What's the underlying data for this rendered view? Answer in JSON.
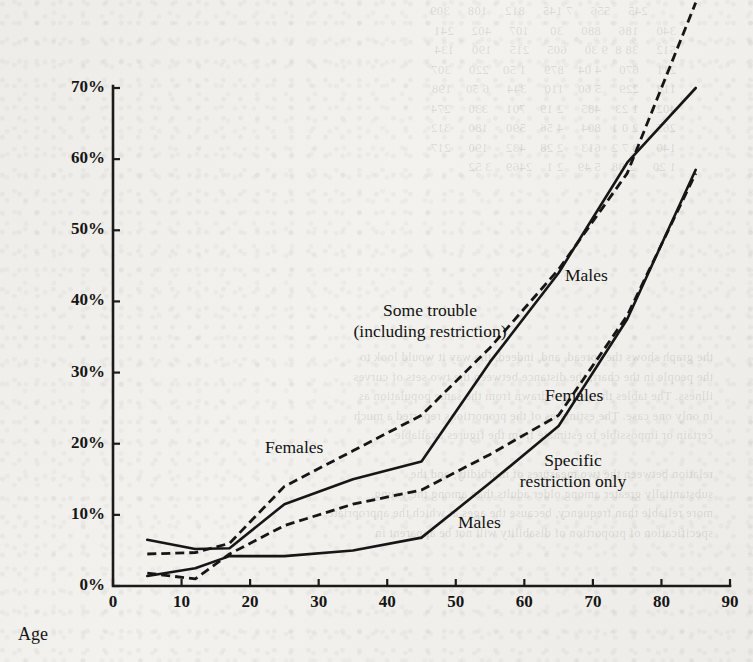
{
  "page": {
    "background_color": "#f2f1ee",
    "ink_color": "#161616",
    "bleed_through_text_top": "          245     556     7 145     812     108     309\n  340     186     880     30      107     402     241\n  512     38 8  9 30     605     215     190     134\n  211     670     4 04    879     1 50    220     307\n  118     229     5 60    110     344     6 50    198\n  402     1 23    485     2 19    701     330     274\n  265     2 0 1   804     4 56    590     180     312\n  140     3 7 2   613     2 28    432     190     217\n  1 20     2 88   5 49    2 1    2469    3 52",
    "bleed_through_text_bottom": "the graph shows the spread, and, indeed, the way it would look to\nthe people in the chart, the distance between the two sets of curves\nillness. The tables that are not drawn from the same population as\nin only one case. The estimates of the proportions reported a much\ncertain or impossible to estimate from the figures available\n\nrelation between the two measures of morbidity, and the\nsubstantially greater among older adults than among the young,\nmore reliable than frequency, because the ages at which the appropriate\nspecification of proportion of disability will not be apparent in"
  },
  "chart_data": {
    "type": "line",
    "title": "",
    "xlabel": "Age",
    "ylabel": "",
    "xlim": [
      0,
      90
    ],
    "ylim": [
      0,
      70
    ],
    "grid": false,
    "legend_position": "inline-annotations",
    "x_ticks": [
      "0",
      "10",
      "20",
      "30",
      "40",
      "50",
      "60",
      "70",
      "80",
      "90"
    ],
    "y_ticks": [
      "0%",
      "10%",
      "20%",
      "30%",
      "40%",
      "50%",
      "60%",
      "70%"
    ],
    "annotations": [
      {
        "text_line1": "Some trouble",
        "text_line2": "(including restriction)",
        "x_px": 430,
        "y_px": 300
      },
      {
        "text_line1": "Specific",
        "text_line2": "restriction only",
        "x_px": 573,
        "y_px": 450
      },
      {
        "text_line1": "Males",
        "text_line2": "",
        "x_px": 565,
        "y_px": 265
      },
      {
        "text_line1": "Females",
        "text_line2": "",
        "x_px": 545,
        "y_px": 385
      },
      {
        "text_line1": "Females",
        "text_line2": "",
        "x_px": 265,
        "y_px": 437
      },
      {
        "text_line1": "Males",
        "text_line2": "",
        "x_px": 458,
        "y_px": 512
      }
    ],
    "series": [
      {
        "name": "Females — some trouble (including restriction)",
        "group": "Females",
        "measure": "Some trouble (including restriction)",
        "style": "dashed",
        "x": [
          5,
          12,
          17,
          25,
          35,
          45,
          55,
          65,
          75,
          85
        ],
        "y": [
          4.5,
          4.7,
          6.0,
          14.0,
          19.0,
          24.0,
          33.5,
          44.5,
          58.0,
          82.0
        ]
      },
      {
        "name": "Males — some trouble (including restriction)",
        "group": "Males",
        "measure": "Some trouble (including restriction)",
        "style": "solid",
        "x": [
          5,
          12,
          17,
          25,
          35,
          45,
          55,
          65,
          75,
          85
        ],
        "y": [
          6.5,
          5.2,
          5.3,
          11.5,
          15.0,
          17.5,
          31.5,
          44.0,
          59.5,
          70.0
        ]
      },
      {
        "name": "Females — specific restriction only",
        "group": "Females",
        "measure": "Specific restriction only",
        "style": "dashed",
        "x": [
          5,
          12,
          17,
          25,
          35,
          45,
          55,
          65,
          75,
          85
        ],
        "y": [
          1.8,
          1.0,
          4.5,
          8.5,
          11.5,
          13.5,
          18.5,
          24.0,
          38.0,
          58.0
        ]
      },
      {
        "name": "Males — specific restriction only",
        "group": "Males",
        "measure": "Specific restriction only",
        "style": "solid",
        "x": [
          5,
          12,
          17,
          25,
          35,
          45,
          55,
          65,
          75,
          85
        ],
        "y": [
          1.4,
          2.5,
          4.2,
          4.2,
          5.0,
          6.8,
          14.5,
          22.5,
          37.5,
          58.5
        ]
      }
    ]
  }
}
